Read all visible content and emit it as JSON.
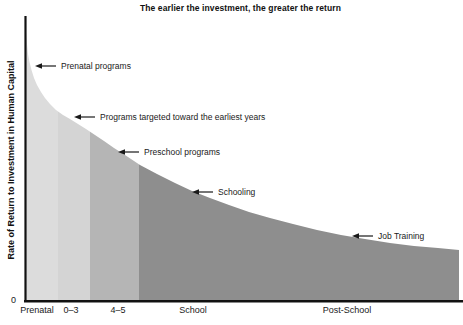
{
  "title": "The earlier the investment, the greater the return",
  "y_axis": {
    "label": "Rate of Return to Investment in Human Capital",
    "origin_label": "0"
  },
  "x_axis": {
    "categories": [
      "Prenatal",
      "0–3",
      "4–5",
      "School",
      "Post-School"
    ]
  },
  "annotations": [
    {
      "text": "Prenatal programs",
      "tip_x": 35,
      "tip_y": 66
    },
    {
      "text": "Programs targeted toward the earliest years",
      "tip_x": 74,
      "tip_y": 117
    },
    {
      "text": "Preschool programs",
      "tip_x": 118,
      "tip_y": 152
    },
    {
      "text": "Schooling",
      "tip_x": 192,
      "tip_y": 192
    },
    {
      "text": "Job Training",
      "tip_x": 352,
      "tip_y": 236
    }
  ],
  "colors": {
    "axis": "#111111",
    "text": "#1a1a1a",
    "band_prenatal": "#dcdcdc",
    "band_0_3": "#d4d4d4",
    "band_4_5": "#b5b5b5",
    "band_school": "#8e8e8e",
    "band_post_school": "#8e8e8e"
  },
  "chart_data": {
    "type": "area",
    "title": "The earlier the investment, the greater the return",
    "xlabel": "",
    "ylabel": "Rate of Return to Investment in Human Capital",
    "x_categories": [
      "Prenatal",
      "0–3",
      "4–5",
      "School",
      "Post-School"
    ],
    "y_origin": "0",
    "relative_return_by_stage": {
      "Prenatal": 1.0,
      "0–3": 0.64,
      "4–5": 0.49,
      "School": 0.35,
      "Post-School": 0.18
    },
    "annotation_labels": [
      "Prenatal programs",
      "Programs targeted toward the earliest years",
      "Preschool programs",
      "Schooling",
      "Job Training"
    ],
    "legend": "none",
    "grid": false,
    "segments": [
      {
        "label": "Prenatal",
        "x0": 25,
        "x1": 58,
        "color": "#dcdcdc",
        "label_cx": 37
      },
      {
        "label": "0–3",
        "x0": 58,
        "x1": 90,
        "color": "#d4d4d4",
        "label_cx": 71
      },
      {
        "label": "4–5",
        "x0": 90,
        "x1": 139,
        "color": "#b5b5b5",
        "label_cx": 118
      },
      {
        "label": "School",
        "x0": 139,
        "x1": 252,
        "color": "#8e8e8e",
        "label_cx": 193
      },
      {
        "label": "Post-School",
        "x0": 252,
        "x1": 459,
        "color": "#8e8e8e",
        "label_cx": 347
      }
    ],
    "curve_px": [
      [
        25,
        17
      ],
      [
        26,
        32
      ],
      [
        27,
        44
      ],
      [
        28,
        54
      ],
      [
        29.5,
        62
      ],
      [
        31.5,
        70
      ],
      [
        34,
        78
      ],
      [
        37,
        85
      ],
      [
        41,
        92
      ],
      [
        45,
        98
      ],
      [
        50,
        104
      ],
      [
        56,
        110
      ],
      [
        63,
        115
      ],
      [
        70,
        119
      ],
      [
        78,
        124
      ],
      [
        86,
        129
      ],
      [
        95,
        135
      ],
      [
        104,
        141
      ],
      [
        114,
        148
      ],
      [
        125,
        155
      ],
      [
        140,
        165
      ],
      [
        157,
        174
      ],
      [
        175,
        183
      ],
      [
        192,
        191
      ],
      [
        210,
        198
      ],
      [
        229,
        205
      ],
      [
        249,
        212
      ],
      [
        270,
        218
      ],
      [
        293,
        224
      ],
      [
        317,
        230
      ],
      [
        341,
        235
      ],
      [
        365,
        239
      ],
      [
        390,
        243
      ],
      [
        414,
        246
      ],
      [
        438,
        248
      ],
      [
        459,
        250
      ]
    ],
    "baseline_y": 301,
    "axis_origin_x": 25,
    "axis_top_y": 16,
    "axis_right_x": 463
  }
}
